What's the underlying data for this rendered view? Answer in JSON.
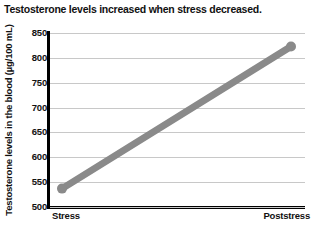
{
  "chart_data": {
    "type": "line",
    "title": "Testosterone levels increased when stress decreased.",
    "xlabel": "",
    "ylabel": "Testosterone levels in the blood (µg/100 mL)",
    "categories": [
      "Stress",
      "Poststress"
    ],
    "values": [
      537,
      823
    ],
    "series": [
      {
        "name": "Testosterone level",
        "values": [
          537,
          823
        ],
        "color": "#8a8a8a",
        "marker": "circle"
      }
    ],
    "ylim": [
      500,
      850
    ],
    "ytick_labels": [
      "850",
      "800",
      "750",
      "700",
      "650",
      "600",
      "550",
      "500"
    ],
    "ytick_values": [
      850,
      800,
      750,
      700,
      650,
      600,
      550,
      500
    ],
    "grid": true,
    "legend": null,
    "legend_position": "none",
    "axis_color": "#000000",
    "gridline_color": "#c8c8c8"
  },
  "figure": {
    "title": "Testosterone levels increased when stress decreased.",
    "y_axis_title": "Testosterone levels in the blood (µg/100 mL)",
    "x_labels": {
      "left": "Stress",
      "right": "Poststress"
    },
    "source_caption": ""
  }
}
